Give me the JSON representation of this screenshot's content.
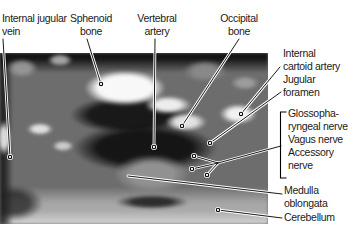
{
  "figure": {
    "type": "labeled-anatomy-scan",
    "background": "#ffffff",
    "text_color": "#1a1a1a",
    "leader_color": "#000000",
    "leader_halo_color": "#ffffff",
    "scan_description": "axial MRI scan at level of medulla oblongata"
  },
  "labels": [
    {
      "id": "internal-jugular-vein",
      "text": "Internal jugular\nvein"
    },
    {
      "id": "sphenoid-bone",
      "text": "Sphenoid\nbone"
    },
    {
      "id": "vertebral-artery",
      "text": "Vertebral\nartery"
    },
    {
      "id": "occipital-bone",
      "text": "Occipital\nbone"
    },
    {
      "id": "internal-cartoid-artery",
      "text": "Internal\ncartoid artery"
    },
    {
      "id": "jugular-foramen",
      "text": "Jugular\nforamen"
    },
    {
      "id": "cranial-nerves-group",
      "text": "Glossopha-\nryngeal nerve\nVagus nerve\nAccessory\nnerve"
    },
    {
      "id": "medulla-oblongata",
      "text": "Medulla\noblongata"
    },
    {
      "id": "cerebellum",
      "text": "Cerebellum"
    }
  ],
  "leaders": [
    {
      "name": "internal-jugular-vein-leader",
      "points": [
        [
          3,
          39
        ],
        [
          10,
          157
        ]
      ],
      "dot": true
    },
    {
      "name": "sphenoid-bone-leader",
      "points": [
        [
          87,
          39
        ],
        [
          101,
          84
        ]
      ],
      "dot": true
    },
    {
      "name": "vertebral-artery-leader",
      "points": [
        [
          155,
          39
        ],
        [
          154,
          147
        ]
      ],
      "dot": true
    },
    {
      "name": "occipital-bone-leader",
      "points": [
        [
          239,
          39
        ],
        [
          182,
          126
        ]
      ],
      "dot": true
    },
    {
      "name": "internal-cartoid-artery-leader",
      "points": [
        [
          280,
          67
        ],
        [
          241,
          114
        ]
      ],
      "dot": true
    },
    {
      "name": "jugular-foramen-leader",
      "points": [
        [
          281,
          92
        ],
        [
          210,
          143
        ]
      ],
      "dot": true
    },
    {
      "name": "nerve-group-trunk",
      "points": [
        [
          281,
          146
        ],
        [
          218,
          163
        ]
      ],
      "dot": false
    },
    {
      "name": "glossopharyngeal-nerve-branch",
      "points": [
        [
          218,
          163
        ],
        [
          194,
          156
        ]
      ],
      "dot": true
    },
    {
      "name": "vagus-nerve-branch",
      "points": [
        [
          218,
          163
        ],
        [
          192,
          169
        ]
      ],
      "dot": true
    },
    {
      "name": "accessory-nerve-branch",
      "points": [
        [
          218,
          163
        ],
        [
          207,
          175
        ]
      ],
      "dot": true
    },
    {
      "name": "medulla-oblongata-leader",
      "points": [
        [
          282,
          194
        ],
        [
          128,
          176
        ]
      ],
      "dot": false
    },
    {
      "name": "cerebellum-leader",
      "points": [
        [
          282,
          218
        ],
        [
          218,
          210
        ]
      ],
      "dot": true
    }
  ],
  "bracket": {
    "points": [
      [
        286.5,
        112
      ],
      [
        280.5,
        112
      ],
      [
        280.5,
        178
      ],
      [
        286.5,
        178
      ]
    ]
  }
}
